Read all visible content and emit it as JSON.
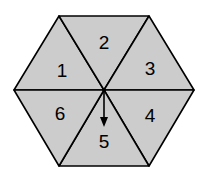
{
  "diagram": {
    "shape": "regular hexagon divided into 6 triangular sectors (spinner)",
    "fill_color": "#cccccc",
    "stroke_color": "#000000",
    "sectors": [
      {
        "label": "1"
      },
      {
        "label": "2"
      },
      {
        "label": "3"
      },
      {
        "label": "4"
      },
      {
        "label": "5"
      },
      {
        "label": "6"
      }
    ],
    "pointer": {
      "points_to": "5"
    }
  }
}
